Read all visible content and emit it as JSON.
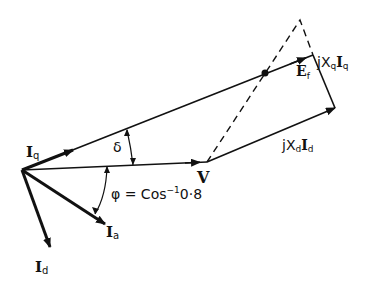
{
  "diagram": {
    "type": "phasor-diagram",
    "colors": {
      "ink": "#111111",
      "background": "#ffffff"
    },
    "labels": {
      "iq": {
        "main": "I",
        "sub": "q"
      },
      "id": {
        "main": "I",
        "sub": "d"
      },
      "ia": {
        "main": "I",
        "sub": "a"
      },
      "v": "V",
      "ef": {
        "main": "E",
        "sub": "f"
      },
      "delta": "δ",
      "phi": "φ = Cos",
      "phi_sup": "−1",
      "phi_val": "0·8",
      "jxqiq": {
        "j": "jX",
        "xsub": "q",
        "i": "I",
        "isub": "q"
      },
      "jxdid": {
        "j": "jX",
        "xsub": "d",
        "i": "I",
        "isub": "d"
      }
    }
  }
}
